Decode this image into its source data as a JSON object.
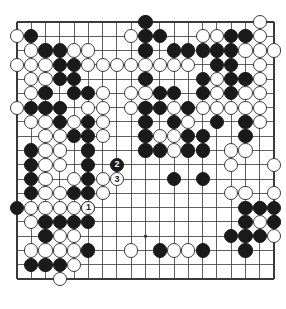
{
  "diagram": {
    "type": "go-board-position",
    "board_size": 19,
    "colors": {
      "background": "#ffffff",
      "line": "#3a3a3a",
      "black_stone": "#1a1a1a",
      "white_stone": "#ffffff",
      "white_stone_border": "#3a3a3a"
    },
    "geometry": {
      "origin_x": 17,
      "origin_y": 22,
      "spacing": 14.28,
      "stone_radius": 7.1,
      "board_border_width": 1.6
    },
    "star_points": [
      [
        4,
        4
      ],
      [
        10,
        4
      ],
      [
        16,
        4
      ],
      [
        4,
        10
      ],
      [
        10,
        10
      ],
      [
        16,
        10
      ],
      [
        4,
        16
      ],
      [
        10,
        16
      ],
      [
        16,
        16
      ]
    ],
    "black_stones": [
      [
        10,
        1
      ],
      [
        2,
        2
      ],
      [
        10,
        2
      ],
      [
        11,
        2
      ],
      [
        16,
        2
      ],
      [
        17,
        2
      ],
      [
        3,
        3
      ],
      [
        4,
        3
      ],
      [
        10,
        3
      ],
      [
        12,
        3
      ],
      [
        13,
        3
      ],
      [
        14,
        3
      ],
      [
        15,
        3
      ],
      [
        16,
        3
      ],
      [
        4,
        4
      ],
      [
        5,
        4
      ],
      [
        15,
        4
      ],
      [
        16,
        4
      ],
      [
        4,
        5
      ],
      [
        5,
        5
      ],
      [
        10,
        5
      ],
      [
        14,
        5
      ],
      [
        16,
        5
      ],
      [
        17,
        5
      ],
      [
        3,
        6
      ],
      [
        5,
        6
      ],
      [
        6,
        6
      ],
      [
        11,
        6
      ],
      [
        12,
        6
      ],
      [
        14,
        6
      ],
      [
        16,
        6
      ],
      [
        2,
        7
      ],
      [
        3,
        7
      ],
      [
        4,
        7
      ],
      [
        10,
        7
      ],
      [
        11,
        7
      ],
      [
        13,
        7
      ],
      [
        4,
        8
      ],
      [
        6,
        8
      ],
      [
        10,
        8
      ],
      [
        12,
        8
      ],
      [
        15,
        8
      ],
      [
        17,
        8
      ],
      [
        5,
        9
      ],
      [
        6,
        9
      ],
      [
        10,
        9
      ],
      [
        13,
        9
      ],
      [
        14,
        9
      ],
      [
        17,
        9
      ],
      [
        2,
        10
      ],
      [
        6,
        10
      ],
      [
        10,
        10
      ],
      [
        11,
        10
      ],
      [
        13,
        10
      ],
      [
        14,
        10
      ],
      [
        2,
        11
      ],
      [
        6,
        11
      ],
      [
        2,
        12
      ],
      [
        6,
        12
      ],
      [
        12,
        12
      ],
      [
        14,
        12
      ],
      [
        2,
        13
      ],
      [
        5,
        13
      ],
      [
        6,
        13
      ],
      [
        1,
        14
      ],
      [
        6,
        14
      ],
      [
        17,
        14
      ],
      [
        18,
        14
      ],
      [
        19,
        14
      ],
      [
        3,
        15
      ],
      [
        4,
        15
      ],
      [
        5,
        15
      ],
      [
        6,
        15
      ],
      [
        17,
        15
      ],
      [
        19,
        15
      ],
      [
        3,
        16
      ],
      [
        16,
        16
      ],
      [
        17,
        16
      ],
      [
        18,
        16
      ],
      [
        6,
        17
      ],
      [
        11,
        17
      ],
      [
        14,
        17
      ],
      [
        17,
        17
      ],
      [
        2,
        18
      ],
      [
        3,
        18
      ],
      [
        4,
        18
      ]
    ],
    "white_stones": [
      [
        18,
        1
      ],
      [
        1,
        2
      ],
      [
        9,
        2
      ],
      [
        14,
        2
      ],
      [
        15,
        2
      ],
      [
        18,
        2
      ],
      [
        2,
        3
      ],
      [
        5,
        3
      ],
      [
        6,
        3
      ],
      [
        17,
        3
      ],
      [
        18,
        3
      ],
      [
        19,
        3
      ],
      [
        1,
        4
      ],
      [
        2,
        4
      ],
      [
        3,
        4
      ],
      [
        6,
        4
      ],
      [
        7,
        4
      ],
      [
        8,
        4
      ],
      [
        9,
        4
      ],
      [
        10,
        4
      ],
      [
        11,
        4
      ],
      [
        12,
        4
      ],
      [
        13,
        4
      ],
      [
        18,
        4
      ],
      [
        2,
        5
      ],
      [
        3,
        5
      ],
      [
        15,
        5
      ],
      [
        18,
        5
      ],
      [
        2,
        6
      ],
      [
        7,
        6
      ],
      [
        9,
        6
      ],
      [
        10,
        6
      ],
      [
        15,
        6
      ],
      [
        17,
        6
      ],
      [
        18,
        6
      ],
      [
        1,
        7
      ],
      [
        6,
        7
      ],
      [
        7,
        7
      ],
      [
        9,
        7
      ],
      [
        12,
        7
      ],
      [
        14,
        7
      ],
      [
        15,
        7
      ],
      [
        16,
        7
      ],
      [
        17,
        7
      ],
      [
        18,
        7
      ],
      [
        2,
        8
      ],
      [
        3,
        8
      ],
      [
        5,
        8
      ],
      [
        7,
        8
      ],
      [
        13,
        8
      ],
      [
        18,
        8
      ],
      [
        3,
        9
      ],
      [
        4,
        9
      ],
      [
        7,
        9
      ],
      [
        11,
        9
      ],
      [
        12,
        9
      ],
      [
        3,
        10
      ],
      [
        4,
        10
      ],
      [
        12,
        10
      ],
      [
        16,
        10
      ],
      [
        17,
        10
      ],
      [
        3,
        11
      ],
      [
        4,
        11
      ],
      [
        16,
        11
      ],
      [
        19,
        11
      ],
      [
        3,
        12
      ],
      [
        5,
        12
      ],
      [
        7,
        12
      ],
      [
        3,
        13
      ],
      [
        4,
        13
      ],
      [
        7,
        13
      ],
      [
        16,
        13
      ],
      [
        17,
        13
      ],
      [
        19,
        13
      ],
      [
        2,
        14
      ],
      [
        3,
        14
      ],
      [
        4,
        14
      ],
      [
        5,
        14
      ],
      [
        18,
        14
      ],
      [
        2,
        15
      ],
      [
        18,
        15
      ],
      [
        19,
        15
      ],
      [
        4,
        16
      ],
      [
        5,
        16
      ],
      [
        19,
        16
      ],
      [
        2,
        17
      ],
      [
        3,
        17
      ],
      [
        4,
        17
      ],
      [
        5,
        17
      ],
      [
        9,
        17
      ],
      [
        12,
        17
      ],
      [
        13,
        17
      ],
      [
        5,
        18
      ],
      [
        4,
        19
      ]
    ],
    "move_markers": [
      {
        "number": "1",
        "color": "white",
        "col": 6,
        "row": 14,
        "label": "move-1-white"
      },
      {
        "number": "2",
        "color": "black",
        "col": 8,
        "row": 11,
        "label": "move-2-black"
      },
      {
        "number": "3",
        "color": "white",
        "col": 8,
        "row": 12,
        "label": "move-3-white"
      }
    ]
  }
}
